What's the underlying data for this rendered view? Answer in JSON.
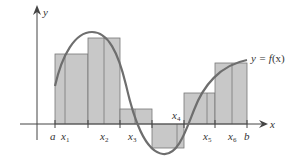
{
  "diagram": {
    "axes": {
      "x_label": "x",
      "y_label": "y"
    },
    "curve_label": "y = f(x)",
    "curve_label_parts": {
      "pre": "y = ",
      "f": "f",
      "x": "(x)"
    },
    "tick_labels": [
      {
        "name": "a",
        "base": "a",
        "sub": ""
      },
      {
        "name": "x1",
        "base": "x",
        "sub": "1"
      },
      {
        "name": "x2",
        "base": "x",
        "sub": "2"
      },
      {
        "name": "x3",
        "base": "x",
        "sub": "3"
      },
      {
        "name": "x4",
        "base": "x",
        "sub": "4"
      },
      {
        "name": "x5",
        "base": "x",
        "sub": "5"
      },
      {
        "name": "x6",
        "base": "x",
        "sub": "6"
      },
      {
        "name": "b",
        "base": "b",
        "sub": ""
      }
    ],
    "rectangles": [
      {
        "index": 1,
        "sign": "positive"
      },
      {
        "index": 2,
        "sign": "positive"
      },
      {
        "index": 3,
        "sign": "positive"
      },
      {
        "index": 4,
        "sign": "negative"
      },
      {
        "index": 5,
        "sign": "positive"
      },
      {
        "index": 6,
        "sign": "positive"
      }
    ],
    "colors": {
      "rect_fill": "#c8c8c8",
      "rect_stroke": "#777777",
      "curve": "#6e6e6e",
      "axis": "#444444"
    }
  }
}
